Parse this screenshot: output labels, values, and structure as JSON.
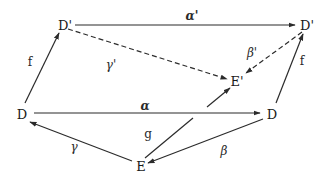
{
  "diagram": {
    "nodes": [
      {
        "id": "Dp_left",
        "label": "D'",
        "x": 65,
        "y": 25
      },
      {
        "id": "Dp_right",
        "label": "D'",
        "x": 306,
        "y": 25
      },
      {
        "id": "Ep",
        "label": "E'",
        "x": 236,
        "y": 80
      },
      {
        "id": "D_left",
        "label": "D",
        "x": 22,
        "y": 113
      },
      {
        "id": "D_right",
        "label": "D",
        "x": 272,
        "y": 113
      },
      {
        "id": "E",
        "label": "E",
        "x": 141,
        "y": 164
      }
    ],
    "edges": [
      {
        "id": "alpha_prime",
        "from": "Dp_left",
        "to": "Dp_right",
        "label": "α'",
        "style": "solid"
      },
      {
        "id": "gamma_prime",
        "from": "Dp_left",
        "to": "Ep",
        "label": "γ'",
        "style": "dashed"
      },
      {
        "id": "beta_prime",
        "from": "Dp_right",
        "to": "Ep",
        "label": "β'",
        "style": "dashed"
      },
      {
        "id": "f_left",
        "from": "D_left",
        "to": "Dp_left",
        "label": "f",
        "style": "solid"
      },
      {
        "id": "f_right",
        "from": "D_right",
        "to": "Dp_right",
        "label": "f",
        "style": "solid"
      },
      {
        "id": "alpha",
        "from": "D_left",
        "to": "D_right",
        "label": "α",
        "style": "solid"
      },
      {
        "id": "g",
        "from": "E",
        "to": "Ep",
        "label": "g",
        "style": "solid"
      },
      {
        "id": "gamma",
        "from": "E",
        "to": "D_left",
        "label": "γ",
        "style": "solid"
      },
      {
        "id": "beta",
        "from": "D_right",
        "to": "E",
        "label": "β",
        "style": "solid"
      }
    ],
    "labels": {
      "alpha_prime": "α'",
      "gamma_prime": "γ'",
      "beta_prime": "β'",
      "f_left": "f",
      "f_right": "f",
      "alpha": "α",
      "g": "g",
      "gamma": "γ",
      "beta": "β"
    },
    "node_labels": {
      "Dp_left": "D'",
      "Dp_right": "D'",
      "Ep": "E'",
      "D_left": "D",
      "D_right": "D",
      "E": "E"
    },
    "colors": {
      "line": "#2b2b2b",
      "text": "#1a1a1a",
      "background": "#ffffff"
    }
  }
}
